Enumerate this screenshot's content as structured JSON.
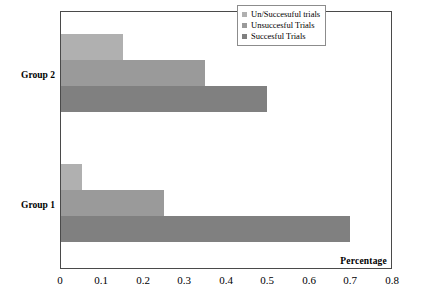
{
  "chart_data": {
    "type": "bar",
    "orientation": "horizontal",
    "title": "",
    "xlabel": "Percentage",
    "ylabel": "",
    "xlim": [
      0,
      0.8
    ],
    "xticks": [
      "0",
      "0.1",
      "0.2",
      "0.3",
      "0.4",
      "0.5",
      "0.6",
      "0.7",
      "0.8"
    ],
    "xtick_values": [
      0,
      0.1,
      0.2,
      0.3,
      0.4,
      0.5,
      0.6,
      0.7,
      0.8
    ],
    "grid": false,
    "legend_position": "top-right",
    "categories": [
      "Group 1",
      "Group 2"
    ],
    "series": [
      {
        "name": "Un/Succesuful trials",
        "color": "#b0b0b0",
        "values": [
          0.05,
          0.15
        ]
      },
      {
        "name": "Unsuccesful Trials",
        "color": "#9a9a9a",
        "values": [
          0.25,
          0.35
        ]
      },
      {
        "name": "Succesful Trials",
        "color": "#808080",
        "values": [
          0.7,
          0.5
        ]
      }
    ]
  },
  "legend": {
    "items": [
      {
        "label": "Un/Succesuful trials",
        "color": "#b0b0b0"
      },
      {
        "label": "Unsuccesful Trials",
        "color": "#9a9a9a"
      },
      {
        "label": "Succesful Trials",
        "color": "#808080"
      }
    ]
  },
  "axis": {
    "x_title": "Percentage",
    "ticks": [
      "0",
      "0.1",
      "0.2",
      "0.3",
      "0.4",
      "0.5",
      "0.6",
      "0.7",
      "0.8"
    ]
  },
  "categories": [
    {
      "label": "Group 1"
    },
    {
      "label": "Group 2"
    }
  ],
  "colors": {
    "frame": "#4a4a4a",
    "background": "#ffffff",
    "light_gray": "#b0b0b0",
    "medium_gray": "#9a9a9a",
    "dark_gray": "#808080"
  }
}
